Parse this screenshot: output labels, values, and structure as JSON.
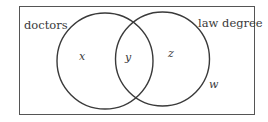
{
  "diagram": {
    "type": "venn",
    "universe_label": "",
    "sets": [
      {
        "name": "doctors",
        "label": "doctors"
      },
      {
        "name": "law degree",
        "label": "law degree"
      }
    ],
    "regions": {
      "doctors_only": "x",
      "both": "y",
      "law_degree_only": "z",
      "neither": "w"
    },
    "colors": {
      "stroke": "#3a3a3a",
      "background": "#ffffff"
    }
  }
}
